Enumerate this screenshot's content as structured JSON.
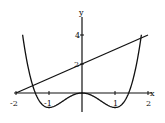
{
  "chart_data": {
    "type": "line",
    "title": "",
    "xlabel": "x",
    "ylabel": "y",
    "xlim": [
      -2,
      2
    ],
    "ylim": [
      -1,
      5
    ],
    "x_ticks": [
      "-2",
      "-1",
      "1",
      "2"
    ],
    "y_ticks": [
      "2",
      "4"
    ],
    "grid": false,
    "series": [
      {
        "name": "y = x^4 - 2x^2",
        "x": [
          -2,
          -1.5,
          -1,
          -0.5,
          0,
          0.5,
          1,
          1.5,
          2
        ],
        "y": [
          8,
          0.5625,
          -1,
          -0.4375,
          0,
          -0.4375,
          -1,
          0.5625,
          8
        ]
      },
      {
        "name": "y = x + 2",
        "x": [
          -2,
          2
        ],
        "y": [
          0,
          4
        ]
      }
    ]
  },
  "labels": {
    "x": "x",
    "y": "y",
    "xm2": "-2",
    "xm1": "-1",
    "x1": "1",
    "x2": "2",
    "y2": "2",
    "y4": "4"
  }
}
